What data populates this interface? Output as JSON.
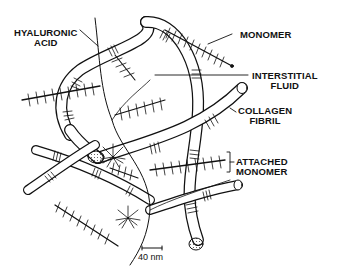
{
  "diagram": {
    "type": "proteoglycan-collagen matrix illustration",
    "labels": {
      "hyaluronic_acid": [
        "HYALURONIC",
        "ACID"
      ],
      "monomer": "MONOMER",
      "interstitial_fluid": [
        "INTERSTITIAL",
        "FLUID"
      ],
      "collagen_fibril": [
        "COLLAGEN",
        "FIBRIL"
      ],
      "attached_monomer": [
        "ATTACHED",
        "MONOMER"
      ]
    },
    "scale_bar": {
      "label": "40 nm"
    },
    "colors": {
      "ink": "#111111",
      "background": "#ffffff",
      "fibril_fill": "#ffffff"
    }
  }
}
